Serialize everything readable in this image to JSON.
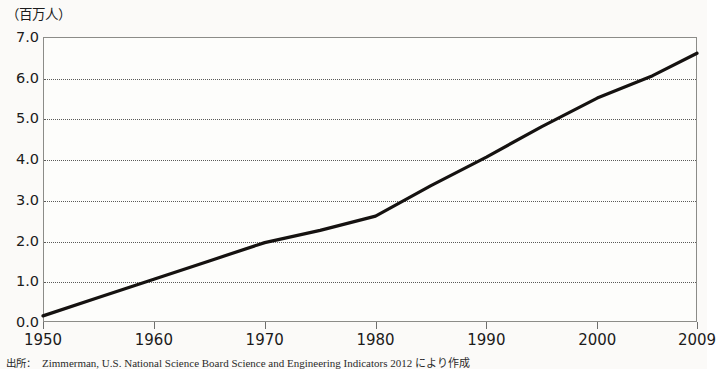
{
  "unit_label": "（百万人）",
  "source": {
    "prefix": "出所：",
    "text": "Zimmerman, U.S. National Science Board Science and Engineering Indicators 2012 により作成"
  },
  "chart_data": {
    "type": "line",
    "title": "",
    "subtitle": "",
    "xlabel": "",
    "ylabel": "（百万人）",
    "grid": true,
    "legend": false,
    "legend_position": "none",
    "line_color": "#151210",
    "line_width": 3.2,
    "xlim": [
      1950,
      2009
    ],
    "ylim": [
      0.0,
      7.0
    ],
    "y_ticks": [
      "7.0",
      "6.0",
      "5.0",
      "4.0",
      "3.0",
      "2.0",
      "1.0",
      "0.0"
    ],
    "y_tick_values": [
      7.0,
      6.0,
      5.0,
      4.0,
      3.0,
      2.0,
      1.0,
      0.0
    ],
    "x_ticks": [
      "1950",
      "1960",
      "1970",
      "1980",
      "1990",
      "2000",
      "2009"
    ],
    "x_tick_values": [
      1950,
      1960,
      1970,
      1980,
      1990,
      2000,
      2009
    ],
    "x": [
      1950,
      1955,
      1960,
      1965,
      1970,
      1975,
      1980,
      1985,
      1990,
      1995,
      2000,
      2005,
      2009
    ],
    "values": [
      0.15,
      0.6,
      1.05,
      1.5,
      1.95,
      2.25,
      2.6,
      3.35,
      4.05,
      4.8,
      5.5,
      6.05,
      6.6
    ],
    "series": [
      {
        "name": "",
        "values": [
          0.15,
          0.6,
          1.05,
          1.5,
          1.95,
          2.25,
          2.6,
          3.35,
          4.05,
          4.8,
          5.5,
          6.05,
          6.6
        ]
      }
    ]
  }
}
